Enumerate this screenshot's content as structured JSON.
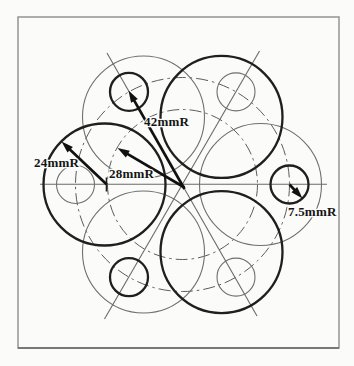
{
  "figure": {
    "canvas": {
      "width": 354,
      "height": 366,
      "background": "#fbfbfa"
    },
    "border": {
      "x": 18,
      "y": 17,
      "w": 321,
      "h": 331,
      "color": "#949494",
      "bottom_color": "#787878",
      "width": 1.5
    },
    "ink": {
      "bold": "#1f1f1f",
      "thin": "#6f6f6f",
      "construction": "#6a6a6a",
      "dashdot": "#5c5c5c",
      "dimension": "#111111"
    },
    "center": {
      "x": 182.5,
      "y": 184.5
    },
    "pitch_circles": [
      {
        "name": "small-circle-pitch-42mm",
        "r": 107,
        "style": "dashdot"
      },
      {
        "name": "large-circle-pitch-28mm",
        "r": 75,
        "style": "dashdot"
      }
    ],
    "large_circles": {
      "radius_px": 61,
      "center_dist_px": 78,
      "angles_deg": [
        0,
        60,
        120,
        180,
        240,
        300
      ],
      "bold_angles": [
        60,
        180,
        300
      ],
      "radius_label": "24mmR"
    },
    "small_circles": {
      "radius_px": 19,
      "center_dist_px": 107,
      "angles_deg": [
        0,
        60,
        120,
        180,
        240,
        300
      ],
      "bold_angles": [
        0,
        120,
        240
      ],
      "radius_label": "7.5mmR"
    },
    "construction_lines": [
      {
        "name": "horizontal-centerline",
        "x1": 40,
        "y1": 184.3,
        "x2": 327,
        "y2": 184.3
      },
      {
        "name": "diagonal-60-centerline",
        "x1": 104.5,
        "y1": 319,
        "x2": 259.5,
        "y2": 51
      },
      {
        "name": "diagonal-120-centerline",
        "x1": 107,
        "y1": 53,
        "x2": 257,
        "y2": 316
      }
    ],
    "center_tick": {
      "x": 106.5,
      "y1": 177.5,
      "y2": 191.5
    },
    "dimensions": [
      {
        "label": "42mmR",
        "tail": [
          184.5,
          189
        ],
        "head": [
          128.5,
          90.5
        ],
        "label_x": 144,
        "label_y": 126
      },
      {
        "label": "28mmR",
        "tail": [
          184.5,
          187.5
        ],
        "head": [
          117.5,
          148
        ],
        "label_x": 109,
        "label_y": 177.5
      },
      {
        "label": "24mmR",
        "tail": [
          106.5,
          184.3
        ],
        "head": [
          61.5,
          141.5
        ],
        "label_x": 34,
        "label_y": 166.5
      },
      {
        "label": "7.5mmR",
        "tail": [
          289.5,
          184.5
        ],
        "head": [
          302.5,
          198.5
        ],
        "label_x": 288,
        "label_y": 215.5
      }
    ],
    "arrow": {
      "shaft_width": 2.7,
      "head_length": 12,
      "head_half_width": 3.9
    },
    "dashdot_pattern": "12 4 2.5 4"
  }
}
